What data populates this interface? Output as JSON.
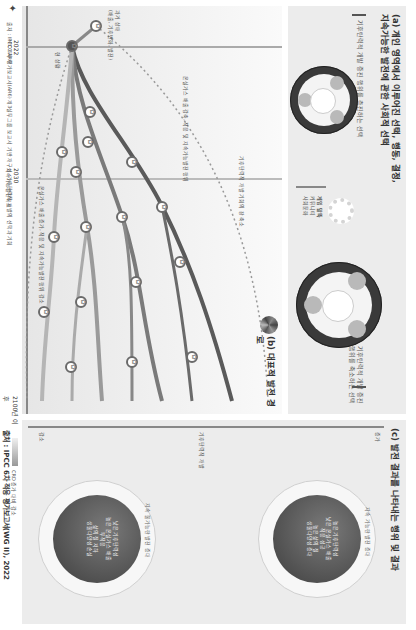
{
  "panel_a": {
    "title_line1": "(a) 개인 영역에서 이루어진 선택, 행동, 결정,",
    "title_line2": "지속가능한 발전에 관한 사회적 선택",
    "left_caption": "기후탄력적 개발 증진 행위를 축소하는 선택",
    "right_caption": "기후탄력적 개발 증진 행위를 촉진하는 선택",
    "gear_legend_title": "게임 말뚝",
    "gear_legend_items": [
      "커뮤니티",
      "사회문화",
      "정치",
      "경제",
      "지식 + 기술",
      "경제 + 금융"
    ]
  },
  "panel_b": {
    "title": "(b) 대표적 발전 경로",
    "past_label": "과거 상태",
    "past_sub": "(배출, 기후변화, 발전)",
    "present_label": "현 상황",
    "upper_path_note": "온실가스 배출 감축, 적응 및 지속가능발전 행위",
    "lower_path_note": "온실가스 배출 증가, 적응 및 지속가능발전 행위 감소",
    "dotted_note": "기후탄력적 개발 기회의 창 축소",
    "sdg_badge": "SDGs"
  },
  "timeline": {
    "marks": [
      {
        "year": "2022",
        "label": "IPCC\nAR6"
      },
      {
        "year": "2030",
        "label": "지속가능발전목표"
      },
      {
        "year": "2100년\n이후",
        "label": ""
      }
    ]
  },
  "panel_c": {
    "title": "(c) 발전 결과를 나타내는 행위 및 결과",
    "axis_low": "감소",
    "axis_mid": "기후탄력적 개발",
    "axis_high": "증가",
    "globe_high": {
      "ring": [
        "지속 가능한 발전 증대",
        "식량",
        "물 안보",
        "생태계",
        "평등"
      ],
      "core": [
        "높은 기후탄력성",
        "낮은 온실가스 배출",
        "적응 성공",
        "높은 삶의 질",
        "생물다양성 증대"
      ]
    },
    "globe_low": {
      "ring": [
        "지속 불가능한 발전 증대",
        "빈곤",
        "불평등",
        "분쟁"
      ],
      "core": [
        "낮은 기후탄력성",
        "높은 온실가스 배출",
        "부적응",
        "삶의 질 저하",
        "생물다양성 손실"
      ]
    }
  },
  "legend": {
    "gradient_label": "CRD 증가 대비 감소"
  },
  "footer": {
    "note": "출처 : IPCC 6차 평가보고서(AR6) 제3실무그룹 보고서 기반 재구성, 기후탄력적 개발의 선택과 기회",
    "source": "출처 : IPCC 6차 적응 평가보고서(WG II), 2022"
  },
  "colors": {
    "panel_bg": "#ececec",
    "path_dark": "#5a5a5a",
    "path_mid": "#8a8a8a",
    "path_light": "#b5b5b5",
    "dial": "#3a3a3a"
  }
}
